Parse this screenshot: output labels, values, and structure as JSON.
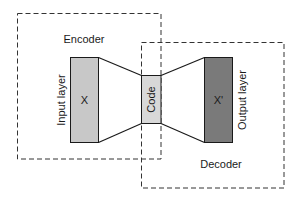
{
  "diagram": {
    "encoder": {
      "label": "Encoder",
      "box": {
        "x": 17.5,
        "y": 13.5,
        "w": 143.5,
        "h": 145.5
      }
    },
    "decoder": {
      "label": "Decoder",
      "box": {
        "x": 141.5,
        "y": 42.5,
        "w": 142.5,
        "h": 145.5
      }
    },
    "input_layer": {
      "label": "Input layer",
      "symbol": "X",
      "fill": "#c8c8c8",
      "rect": {
        "x": 70.5,
        "y": 57.5,
        "w": 28,
        "h": 85
      }
    },
    "code_layer": {
      "label": "Code",
      "fill": "#d8d8d8",
      "rect": {
        "x": 141.5,
        "y": 75.5,
        "w": 19.5,
        "h": 48
      }
    },
    "output_layer": {
      "label": "Output layer",
      "symbol": "X'",
      "fill": "#7a7a7a",
      "rect": {
        "x": 204.5,
        "y": 57.5,
        "w": 28,
        "h": 85
      }
    },
    "colors": {
      "stroke": "#1a1a1a",
      "dash": "#333333",
      "background": "#ffffff"
    }
  }
}
